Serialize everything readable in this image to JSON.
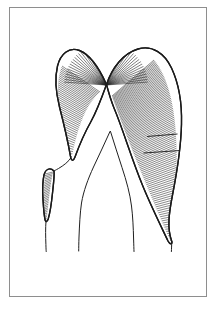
{
  "figure": {
    "description": "Black-ink scientific line drawing of an arched, band-like structure with dense perpendicular hatching, a radial fan of hatch lines at the apex, a small hatched lobe at lower left, and thin unshaded contour lines descending at centre.",
    "style": "pen-and-ink line drawing",
    "background_color": "#ffffff",
    "ink_color": "#1a1a1a",
    "hatch_color": "#2a2a2a",
    "frame_color": "#8e8e8e"
  },
  "frame": {
    "name": "plate-border",
    "x": 9,
    "y": 7,
    "width": 197,
    "height": 289,
    "stroke_width": 1
  },
  "shapes": {
    "main_arch": {
      "name": "main-arch-band",
      "label": "arched hatched band",
      "apex_point": [
        106,
        84
      ],
      "outer_path": "M 106.5 84.5 C 100 70 92 55.5 79.5 50.5 C 69 46.5 60.5 54 57.5 66 C 54.5 78.5 56 93 59.5 107 C 64 124.5 68 142 70.5 156.5 C 71.5 162 73.5 161 75 157 C 79 146 84.5 133 91 121.5 C 96.5 111.5 102 97 106.5 84.5 Z",
      "right_path": "M 106.5 84.5 C 112 68 123 53.5 138 49 C 152 44.8 164.5 53 171.5 68 C 179 84 182 104 181.5 124 C 181 148 177 172 172.5 195 C 169 213 167 228 171.5 240.5 C 173 244.5 170 245 168 241 C 160 224 150 204 142 184 C 131 157 122.5 128 114 108 C 111 100.5 108.5 92 106.5 84.5 Z",
      "left_tip": [
        71,
        157
      ],
      "right_tip": [
        172,
        241
      ]
    },
    "small_lobe": {
      "name": "small-hatched-lobe",
      "label": "small lateral hatched lobe",
      "path": "M 54 171 C 50 167 45.5 169 44 175 C 42.5 181.5 42.5 191 43 199.5 C 43.5 208 44 215 45 219.5 C 45.6 222.5 47.2 222 48.2 219 C 50 213 51.5 203 52.5 193 C 53.6 183 54.6 175 54 171 Z",
      "top_point": [
        54,
        171
      ],
      "bottom_point": [
        46,
        221
      ]
    }
  },
  "thin_lines": {
    "name": "inner-contour-lines",
    "inner_v_apex": [
      110,
      131
    ],
    "paths": [
      {
        "name": "inner-left-contour",
        "d": "M 110 131.5 C 105 143 99 155 93.5 167 C 88 179 83.5 191 81.5 203 C 80 213 79.5 225 79 237 C 78.8 243 78.7 248 78.7 251"
      },
      {
        "name": "inner-right-contour",
        "d": "M 110.5 131.5 C 114 143 118 155 122 167.5 C 126.5 181 130 194 131.5 206 C 132.8 216 133.3 228 133.6 239 C 133.8 245 133.9 249 134 251.5"
      },
      {
        "name": "left-stem-line",
        "d": "M 71.5 157 C 68.5 162 63.5 165.5 58.5 168.5 C 55.5 170.2 54.4 170.7 54 171"
      },
      {
        "name": "lobe-descender",
        "d": "M 46 221 C 45.4 228 45.6 237 45.9 244.5 C 46 248.5 46.1 250.5 46.2 251.5"
      },
      {
        "name": "right-descender",
        "d": "M 171.8 241.5 C 171.6 245.5 171.5 249 171.4 251.5"
      }
    ]
  },
  "hatching": {
    "fan": {
      "name": "apex-radial-fan",
      "label": "radial fan hatching at apex",
      "convergence_point": [
        106,
        85
      ],
      "ray_count": 46,
      "start_angle_deg": 184,
      "end_angle_deg": 356
    },
    "left_limb": {
      "name": "left-limb-hatching",
      "label": "perpendicular hatching on left limb",
      "line_count": 40,
      "orientation": "across-band"
    },
    "right_limb": {
      "name": "right-limb-hatching",
      "label": "perpendicular hatching on right limb",
      "line_count": 96,
      "orientation": "across-band"
    },
    "small_lobe": {
      "name": "small-lobe-hatching",
      "label": "perpendicular hatching on small lobe",
      "line_count": 28,
      "orientation": "across-band"
    },
    "seams": [
      {
        "name": "seam-upper-right",
        "d": "M 147 136.5 L 177.5 134"
      },
      {
        "name": "seam-mid-right",
        "d": "M 143.5 153 L 180 150.5"
      }
    ]
  }
}
